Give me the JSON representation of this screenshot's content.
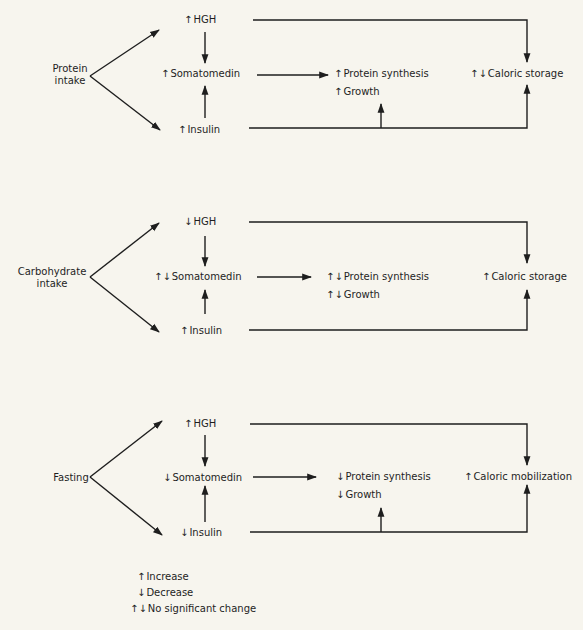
{
  "symbols": {
    "increase": "↑",
    "decrease": "↓",
    "no_change": "↑↓"
  },
  "panels": [
    {
      "source": [
        "Protein",
        "intake"
      ],
      "hgh": {
        "ind": "↑",
        "label": "HGH"
      },
      "somatomedin": {
        "ind": "↑",
        "label": "Somatomedin"
      },
      "insulin": {
        "ind": "↑",
        "label": "Insulin"
      },
      "protein_synthesis": {
        "ind": "↑",
        "label": "Protein synthesis"
      },
      "growth": {
        "ind": "↑",
        "label": "Growth"
      },
      "caloric": {
        "ind": "↑↓",
        "label": "Caloric storage"
      }
    },
    {
      "source": [
        "Carbohydrate",
        "intake"
      ],
      "hgh": {
        "ind": "↓",
        "label": "HGH"
      },
      "somatomedin": {
        "ind": "↑↓",
        "label": "Somatomedin"
      },
      "insulin": {
        "ind": "↑",
        "label": "Insulin"
      },
      "protein_synthesis": {
        "ind": "↑↓",
        "label": "Protein synthesis"
      },
      "growth": {
        "ind": "↑↓",
        "label": "Growth"
      },
      "caloric": {
        "ind": "↑",
        "label": "Caloric storage"
      }
    },
    {
      "source": [
        "Fasting"
      ],
      "hgh": {
        "ind": "↑",
        "label": "HGH"
      },
      "somatomedin": {
        "ind": "↓",
        "label": "Somatomedin"
      },
      "insulin": {
        "ind": "↓",
        "label": "Insulin"
      },
      "protein_synthesis": {
        "ind": "↓",
        "label": "Protein synthesis"
      },
      "growth": {
        "ind": "↓",
        "label": "Growth"
      },
      "caloric": {
        "ind": "↑",
        "label": "Caloric mobilization"
      }
    }
  ],
  "legend": [
    {
      "ind": "↑",
      "label": "Increase"
    },
    {
      "ind": "↓",
      "label": "Decrease"
    },
    {
      "ind": "↑↓",
      "label": "No significant change"
    }
  ]
}
